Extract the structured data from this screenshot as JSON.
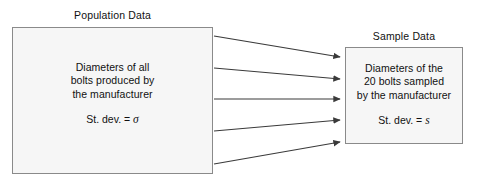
{
  "diagram": {
    "background_color": "#ffffff",
    "box_fill_color": "#f6f6f6",
    "box_border_color": "#8a8a8a",
    "arrow_color": "#3a3a3a",
    "text_color": "#111111"
  },
  "population": {
    "title": "Population Data",
    "lines": [
      "Diameters of all",
      "bolts produced by",
      "the manufacturer"
    ],
    "stdev_label": "St. dev. =",
    "stdev_symbol": "σ"
  },
  "sample": {
    "title": "Sample Data",
    "lines": [
      "Diameters of the",
      "20 bolts sampled",
      "by the manufacturer"
    ],
    "stdev_label": "St. dev. =",
    "stdev_symbol": "s"
  },
  "arrows": {
    "count": 5,
    "description": "Five arrows pointing from the Population Data box to the Sample Data box",
    "paths": [
      {
        "x1": 214,
        "y1": 36,
        "x2": 343,
        "y2": 57
      },
      {
        "x1": 214,
        "y1": 68,
        "x2": 343,
        "y2": 79
      },
      {
        "x1": 214,
        "y1": 99,
        "x2": 343,
        "y2": 99
      },
      {
        "x1": 214,
        "y1": 131,
        "x2": 343,
        "y2": 120
      },
      {
        "x1": 214,
        "y1": 164,
        "x2": 343,
        "y2": 142
      }
    ]
  }
}
